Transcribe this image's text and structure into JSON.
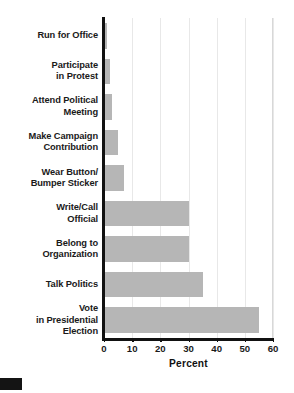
{
  "chart_data": {
    "type": "bar",
    "orientation": "horizontal",
    "title": "",
    "xlabel": "Percent",
    "ylabel": "",
    "xlim": [
      0,
      60
    ],
    "xticks": [
      0,
      10,
      20,
      30,
      40,
      50,
      60
    ],
    "xtick_labels": [
      "0",
      "10",
      "20",
      "30",
      "40",
      "50",
      "60"
    ],
    "grid": "vertical",
    "legend": "none",
    "bar_color": "#b6b6b6",
    "axis_color": "#111111",
    "gridline_color": "#e8e8e8",
    "categories": [
      "Run for Office",
      "Participate in Protest",
      "Attend Political Meeting",
      "Make Campaign Contribution",
      "Wear Button/ Bumper Sticker",
      "Write/Call Official",
      "Belong to Organization",
      "Talk Politics",
      "Vote in Presidential Election"
    ],
    "category_lines": [
      [
        "Run for Office"
      ],
      [
        "Participate",
        "in Protest"
      ],
      [
        "Attend Political",
        "Meeting"
      ],
      [
        "Make Campaign",
        "Contribution"
      ],
      [
        "Wear Button/",
        "Bumper Sticker"
      ],
      [
        "Write/Call",
        "Official"
      ],
      [
        "Belong to",
        "Organization"
      ],
      [
        "Talk Politics"
      ],
      [
        "Vote",
        "in Presidential",
        "Election"
      ]
    ],
    "values": [
      1,
      2,
      3,
      5,
      7,
      30,
      30,
      35,
      55
    ]
  },
  "marks": {
    "corner_block": ""
  }
}
